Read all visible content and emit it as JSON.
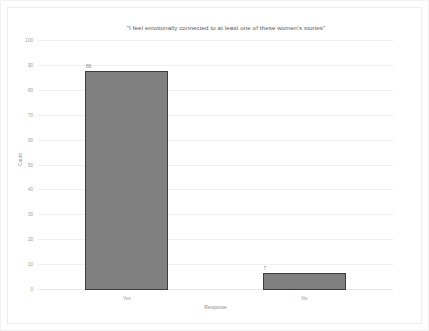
{
  "chart_data": {
    "type": "bar",
    "title": "\"I feel emotionally connected to at least one of these women's stories\"",
    "xlabel": "Response",
    "ylabel": "Count",
    "categories": [
      "Yes",
      "No"
    ],
    "values": [
      88,
      7
    ],
    "value_labels": [
      "88",
      "7"
    ],
    "ylim": [
      0,
      100
    ],
    "yticks": [
      0,
      10,
      20,
      30,
      40,
      50,
      60,
      70,
      80,
      90,
      100
    ],
    "ytick_labels": [
      "0",
      "10",
      "20",
      "30",
      "40",
      "50",
      "60",
      "70",
      "80",
      "90",
      "100"
    ],
    "grid": true,
    "legend": null,
    "bar_color": "#808080",
    "bar_edge_color": "#3d3d3d",
    "background_color": "#ffffff",
    "gridline_color": "#f0f0f2",
    "text_color": "#9a9a9a"
  }
}
